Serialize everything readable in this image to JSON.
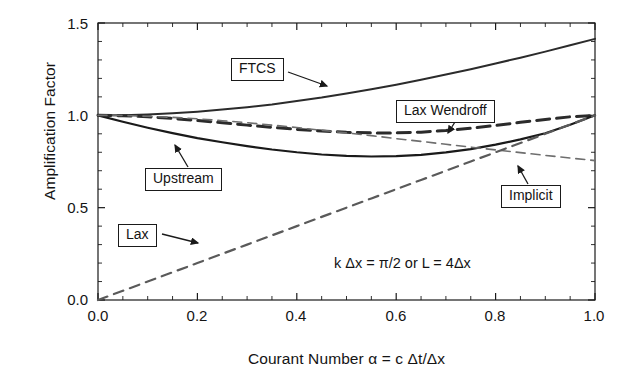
{
  "figure": {
    "background": "#ffffff",
    "ink": "#1a1a1a"
  },
  "axes": {
    "x_title": "Courant Number α = c Δt/Δx",
    "y_title": "Amplification Factor",
    "x_ticks": [
      "0.0",
      "0.2",
      "0.4",
      "0.6",
      "0.8",
      "1.0"
    ],
    "y_ticks": [
      "0.0",
      "0.5",
      "1.0",
      "1.5"
    ]
  },
  "annotation": {
    "condition": "k Δx = π/2 or L = 4Δx"
  },
  "callouts": {
    "ftcs": "FTCS",
    "lax_wendroff": "Lax Wendroff",
    "upstream": "Upstream",
    "implicit": "Implicit",
    "lax": "Lax"
  },
  "chart_data": {
    "type": "line",
    "title": "",
    "subtitle": "",
    "xlabel": "Courant Number α = c Δt/Δx",
    "ylabel": "Amplification Factor",
    "xlim": [
      0.0,
      1.0
    ],
    "ylim": [
      0.0,
      1.5
    ],
    "xticks": [
      0.0,
      0.2,
      0.4,
      0.6,
      0.8,
      1.0
    ],
    "yticks": [
      0.0,
      0.5,
      1.0,
      1.5
    ],
    "grid": false,
    "legend": "none (inline boxed callouts with leader arrows)",
    "minor_ticks": true,
    "annotations": [
      {
        "text": "k Δx = π/2 or L = 4Δx",
        "x": 0.55,
        "y": 0.28
      }
    ],
    "x": [
      0.0,
      0.05,
      0.1,
      0.15,
      0.2,
      0.25,
      0.3,
      0.35,
      0.4,
      0.45,
      0.5,
      0.55,
      0.6,
      0.65,
      0.7,
      0.75,
      0.8,
      0.85,
      0.9,
      0.95,
      1.0
    ],
    "series": [
      {
        "name": "FTCS",
        "style": "solid",
        "color": "#2b2b2b",
        "width": 2.0,
        "values": [
          1.0,
          1.001,
          1.005,
          1.011,
          1.02,
          1.031,
          1.044,
          1.059,
          1.077,
          1.096,
          1.118,
          1.141,
          1.166,
          1.193,
          1.221,
          1.25,
          1.281,
          1.312,
          1.345,
          1.379,
          1.414
        ]
      },
      {
        "name": "Lax Wendroff",
        "style": "dashed",
        "color": "#2b2b2b",
        "width": 3.0,
        "values": [
          1.0,
          0.998,
          0.992,
          0.983,
          0.972,
          0.96,
          0.947,
          0.935,
          0.924,
          0.915,
          0.908,
          0.905,
          0.905,
          0.909,
          0.918,
          0.93,
          0.945,
          0.962,
          0.978,
          0.992,
          1.0
        ]
      },
      {
        "name": "Upstream",
        "style": "solid",
        "color": "#1a1a1a",
        "width": 2.2,
        "values": [
          1.0,
          0.965,
          0.933,
          0.904,
          0.877,
          0.854,
          0.833,
          0.815,
          0.8,
          0.788,
          0.78,
          0.777,
          0.779,
          0.786,
          0.799,
          0.817,
          0.841,
          0.87,
          0.903,
          0.949,
          1.0
        ]
      },
      {
        "name": "Implicit",
        "style": "dashed",
        "color": "#6e6e6e",
        "width": 1.6,
        "values": [
          1.0,
          0.999,
          0.995,
          0.989,
          0.981,
          0.971,
          0.96,
          0.947,
          0.934,
          0.919,
          0.905,
          0.89,
          0.874,
          0.859,
          0.843,
          0.828,
          0.813,
          0.798,
          0.783,
          0.769,
          0.755
        ]
      },
      {
        "name": "Lax",
        "style": "dashed",
        "color": "#5a5a5a",
        "width": 2.2,
        "values": [
          0.0,
          0.05,
          0.1,
          0.15,
          0.2,
          0.25,
          0.3,
          0.35,
          0.4,
          0.45,
          0.5,
          0.55,
          0.6,
          0.65,
          0.7,
          0.75,
          0.8,
          0.85,
          0.9,
          0.95,
          1.0
        ]
      }
    ]
  }
}
